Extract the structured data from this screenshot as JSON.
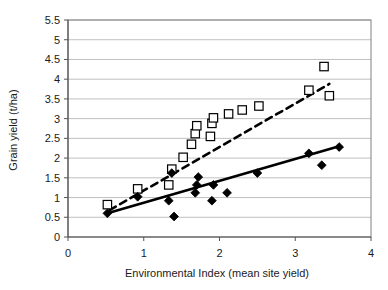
{
  "chart_data": {
    "type": "scatter",
    "title": "",
    "xlabel": "Environmental Index (mean site yield)",
    "ylabel": "Grain yield (t/ha)",
    "xlim": [
      0,
      4
    ],
    "ylim": [
      0,
      5.5
    ],
    "xticks": [
      0,
      1,
      2,
      3,
      4
    ],
    "xticklabels": [
      "0",
      "1",
      "2",
      "3",
      "4"
    ],
    "yticks": [
      0,
      0.5,
      1,
      1.5,
      2,
      2.5,
      3,
      3.5,
      4,
      4.5,
      5,
      5.5
    ],
    "yticklabels": [
      "0",
      "0.5",
      "1",
      "1.5",
      "2",
      "2.5",
      "3",
      "3.5",
      "4",
      "4.5",
      "5",
      "5.5"
    ],
    "grid": "horizontal",
    "legend": "none",
    "series": [
      {
        "name": "open-square-series",
        "marker": "open-square",
        "color": "#000000",
        "points": [
          [
            0.52,
            0.82
          ],
          [
            0.92,
            1.22
          ],
          [
            1.33,
            1.32
          ],
          [
            1.37,
            1.72
          ],
          [
            1.52,
            2.02
          ],
          [
            1.63,
            2.35
          ],
          [
            1.68,
            2.62
          ],
          [
            1.7,
            2.82
          ],
          [
            1.88,
            2.55
          ],
          [
            1.9,
            2.88
          ],
          [
            1.92,
            3.02
          ],
          [
            2.12,
            3.12
          ],
          [
            2.3,
            3.22
          ],
          [
            2.52,
            3.32
          ],
          [
            3.18,
            3.72
          ],
          [
            3.38,
            4.32
          ],
          [
            3.45,
            3.58
          ]
        ],
        "trendline": {
          "style": "dashed",
          "x": [
            0.55,
            3.45
          ],
          "y": [
            0.68,
            3.88
          ]
        }
      },
      {
        "name": "filled-diamond-series",
        "marker": "filled-diamond",
        "color": "#000000",
        "points": [
          [
            0.52,
            0.6
          ],
          [
            0.92,
            1.02
          ],
          [
            1.33,
            0.92
          ],
          [
            1.37,
            1.62
          ],
          [
            1.4,
            0.52
          ],
          [
            1.68,
            1.12
          ],
          [
            1.7,
            1.32
          ],
          [
            1.72,
            1.52
          ],
          [
            1.9,
            0.92
          ],
          [
            1.92,
            1.32
          ],
          [
            2.1,
            1.12
          ],
          [
            2.5,
            1.62
          ],
          [
            3.18,
            2.12
          ],
          [
            3.35,
            1.82
          ],
          [
            3.58,
            2.28
          ]
        ],
        "trendline": {
          "style": "solid",
          "x": [
            0.52,
            3.58
          ],
          "y": [
            0.6,
            2.3
          ]
        }
      }
    ]
  }
}
